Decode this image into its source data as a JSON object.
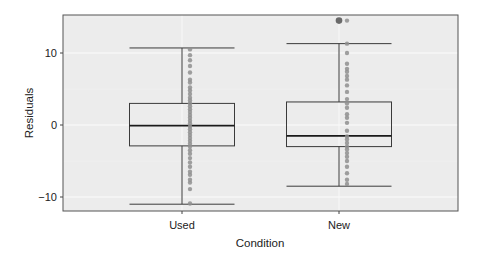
{
  "chart_data": {
    "type": "box",
    "title": "",
    "xlabel": "Condition",
    "ylabel": "Residuals",
    "categories": [
      "Used",
      "New"
    ],
    "ylim": [
      -12,
      15.3
    ],
    "yticks": [
      -10,
      0,
      10
    ],
    "ytick_labels": [
      "−10",
      "0",
      "10"
    ],
    "grid": true,
    "legend": null,
    "colors": {
      "panel_background": "#ececec",
      "gridline": "#f7f7f7",
      "box_line": "#3a3a3a",
      "points": "#8f8f8f",
      "outlier": "#6a6a6a",
      "panel_border": "#555555"
    },
    "series": [
      {
        "name": "Used",
        "whisker_low": -11.0,
        "q1": -2.9,
        "median": -0.1,
        "q3": 3.0,
        "whisker_high": 10.7,
        "outliers": [],
        "points": [
          10.5,
          9.7,
          9.0,
          8.2,
          7.3,
          6.3,
          5.9,
          5.2,
          4.8,
          4.3,
          3.8,
          3.4,
          3.0,
          2.6,
          2.2,
          1.8,
          1.4,
          1.0,
          0.6,
          0.2,
          -0.2,
          -0.6,
          -1.0,
          -1.4,
          -1.8,
          -2.2,
          -2.6,
          -3.0,
          -3.5,
          -4.0,
          -4.6,
          -5.2,
          -5.8,
          -6.5,
          -6.9,
          -7.6,
          -8.0,
          -8.9,
          -10.9
        ]
      },
      {
        "name": "New",
        "whisker_low": -8.5,
        "q1": -3.0,
        "median": -1.5,
        "q3": 3.2,
        "whisker_high": 11.3,
        "outliers": [
          14.5
        ],
        "points": [
          14.5,
          11.3,
          10.0,
          8.5,
          7.8,
          7.4,
          6.8,
          6.3,
          5.5,
          4.6,
          3.6,
          3.0,
          2.4,
          1.5,
          1.0,
          0.3,
          -0.8,
          -1.6,
          -2.0,
          -2.5,
          -3.0,
          -3.4,
          -3.9,
          -4.4,
          -5.0,
          -5.8,
          -6.7,
          -7.6,
          -8.2
        ]
      }
    ]
  }
}
